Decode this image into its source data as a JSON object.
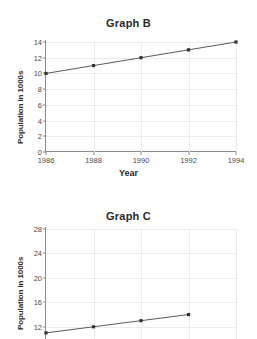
{
  "chart_data": [
    {
      "type": "line",
      "title": "Graph B",
      "xlabel": "Year",
      "ylabel": "Population in 1000s",
      "x": [
        1986,
        1988,
        1990,
        1992,
        1994
      ],
      "xticklabels": [
        "1986",
        "1988",
        "1990",
        "1992",
        "1994"
      ],
      "yticks": [
        0,
        2,
        4,
        6,
        8,
        10,
        12,
        14
      ],
      "yticklabels": [
        "0",
        "2",
        "4",
        "6",
        "8",
        "10",
        "12",
        "14"
      ],
      "xlim": [
        1986,
        1994
      ],
      "ylim": [
        0,
        14
      ],
      "grid": true,
      "legend": "none",
      "series": [
        {
          "name": "Population",
          "values": [
            10,
            11,
            12,
            13,
            14
          ]
        }
      ]
    },
    {
      "type": "line",
      "title": "Graph C",
      "xlabel": "",
      "ylabel": "Population in 1000s",
      "x": [
        1986,
        1988,
        1990,
        1992,
        1994
      ],
      "xticklabels": [
        "",
        "",
        "",
        "",
        ""
      ],
      "yticks": [
        12,
        16,
        20,
        24,
        28
      ],
      "yticklabels": [
        "12",
        "16",
        "20",
        "24",
        "28"
      ],
      "xlim": [
        1986,
        1994
      ],
      "ylim": [
        10,
        28
      ],
      "grid": true,
      "legend": "none",
      "note": "bottom of chart is cropped by the screenshot edge",
      "series": [
        {
          "name": "Population",
          "values": [
            11,
            12,
            13,
            14
          ]
        }
      ]
    }
  ]
}
